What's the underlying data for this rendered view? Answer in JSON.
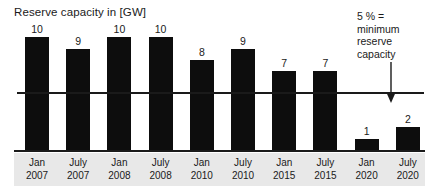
{
  "chart_data": {
    "type": "bar",
    "title": "Reserve capacity in [GW]",
    "xlabel": "",
    "ylabel": "",
    "ylim": [
      0,
      11
    ],
    "grid": false,
    "legend": null,
    "categories": [
      "Jan 2007",
      "July 2007",
      "Jan 2008",
      "July 2008",
      "Jan 2010",
      "July 2010",
      "Jan 2015",
      "July 2015",
      "Jan 2020",
      "July 2020"
    ],
    "tick_labels": [
      {
        "month": "Jan",
        "year": "2007"
      },
      {
        "month": "July",
        "year": "2007"
      },
      {
        "month": "Jan",
        "year": "2008"
      },
      {
        "month": "July",
        "year": "2008"
      },
      {
        "month": "Jan",
        "year": "2010"
      },
      {
        "month": "July",
        "year": "2010"
      },
      {
        "month": "Jan",
        "year": "2015"
      },
      {
        "month": "July",
        "year": "2015"
      },
      {
        "month": "Jan",
        "year": "2020"
      },
      {
        "month": "July",
        "year": "2020"
      }
    ],
    "values": [
      10,
      9,
      10,
      10,
      8,
      9,
      7,
      7,
      1,
      2
    ],
    "value_labels": [
      "10",
      "9",
      "10",
      "10",
      "8",
      "9",
      "7",
      "7",
      "1",
      "2"
    ],
    "reference_line": {
      "value": 5,
      "label_lines": [
        "5 % =",
        "minimum",
        "reserve",
        "capacity"
      ],
      "arrow": "down-arrow"
    },
    "colors": {
      "bar": "#0d0d0d",
      "background": "#ffffff",
      "axis": "#1a1a1a",
      "tick_band": "#e8e8e8",
      "text": "#1a1a1a"
    }
  }
}
